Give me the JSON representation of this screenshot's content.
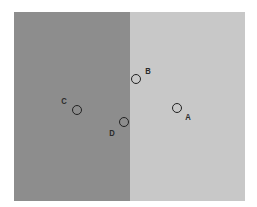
{
  "figure": {
    "regions": [
      {
        "id": "left",
        "color": "#8d8d8d"
      },
      {
        "id": "right",
        "color": "#c8c8c8"
      }
    ],
    "points": [
      {
        "label": "A",
        "cx": 177,
        "cy": 108,
        "label_x": 188,
        "label_y": 117
      },
      {
        "label": "B",
        "cx": 136,
        "cy": 79,
        "label_x": 148,
        "label_y": 71
      },
      {
        "label": "C",
        "cx": 77,
        "cy": 110,
        "label_x": 64,
        "label_y": 101
      },
      {
        "label": "D",
        "cx": 124,
        "cy": 122,
        "label_x": 112,
        "label_y": 133
      }
    ]
  }
}
